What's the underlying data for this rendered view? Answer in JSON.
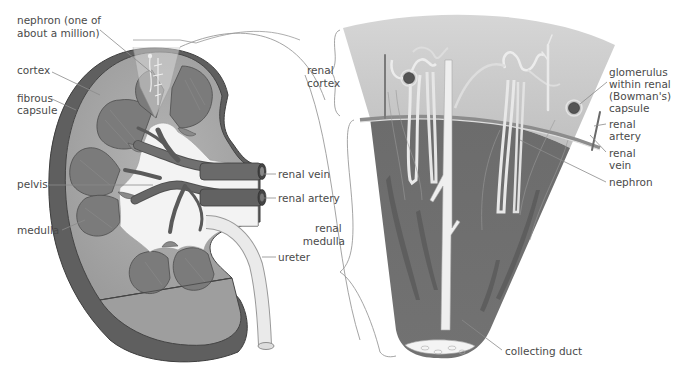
{
  "diagram": {
    "left_panel": {
      "name": "kidney-cross-section",
      "labels": [
        {
          "id": "nephron",
          "lines": [
            "nephron (one of",
            "about a million)"
          ]
        },
        {
          "id": "cortex",
          "lines": [
            "cortex"
          ]
        },
        {
          "id": "fibrous_capsule",
          "lines": [
            "fibrous",
            "capsule"
          ]
        },
        {
          "id": "pelvis",
          "lines": [
            "pelvis"
          ]
        },
        {
          "id": "medulla",
          "lines": [
            "medulla"
          ]
        },
        {
          "id": "renal_vein",
          "lines": [
            "renal vein"
          ]
        },
        {
          "id": "renal_artery",
          "lines": [
            "renal artery"
          ]
        },
        {
          "id": "ureter",
          "lines": [
            "ureter"
          ]
        }
      ]
    },
    "right_panel": {
      "name": "renal-pyramid-detail",
      "labels": [
        {
          "id": "renal_cortex",
          "lines": [
            "renal",
            "cortex"
          ]
        },
        {
          "id": "renal_medulla",
          "lines": [
            "renal",
            "medulla"
          ]
        },
        {
          "id": "glomerulus",
          "lines": [
            "glomerulus",
            "within renal",
            "(Bowman's)",
            "capsule"
          ]
        },
        {
          "id": "renal_artery",
          "lines": [
            "renal",
            "artery"
          ]
        },
        {
          "id": "renal_vein",
          "lines": [
            "renal",
            "vein"
          ]
        },
        {
          "id": "nephron",
          "lines": [
            "nephron"
          ]
        },
        {
          "id": "collecting_duct",
          "lines": [
            "collecting duct"
          ]
        }
      ]
    },
    "colors": {
      "cortex": "#a9a9a9",
      "medulla_pyramid": "#7a7a7a",
      "capsule_outer": "#5e5e5e",
      "pelvis_light": "#f2f2f2",
      "vessel": "#6a6a6a",
      "detail_cortex": "#c4c4c4",
      "detail_medulla": "#6e6e6e",
      "text": "#4a4a4a"
    }
  }
}
